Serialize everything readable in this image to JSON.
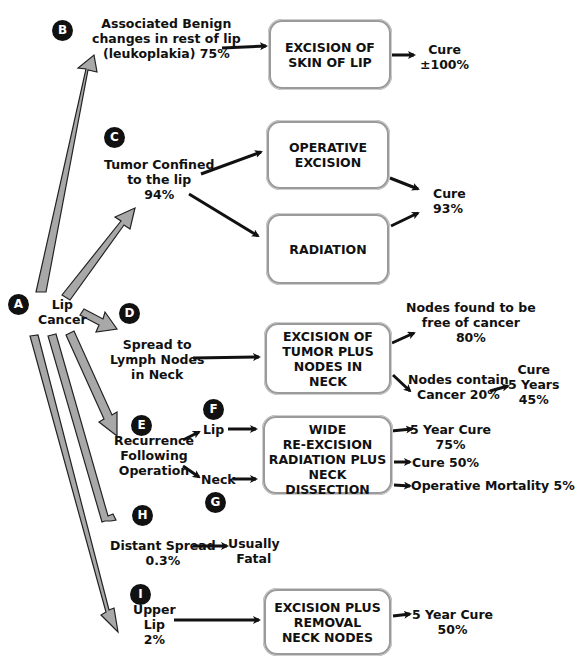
{
  "diagram": {
    "root": {
      "badge": "A",
      "label_lines": [
        "Lip",
        "Cancer"
      ]
    },
    "branches": {
      "B": {
        "badge": "B",
        "label_lines": [
          "Associated Benign",
          "changes in rest of lip",
          "(leukoplakia) 75%"
        ]
      },
      "C": {
        "badge": "C",
        "label_lines": [
          "Tumor Confined",
          "to the lip",
          "94%"
        ]
      },
      "D": {
        "badge": "D",
        "label_lines": [
          "Spread to",
          "Lymph Nodes",
          "in Neck"
        ]
      },
      "E": {
        "badge": "E",
        "label_lines": [
          "Recurrence",
          "Following",
          "Operation"
        ]
      },
      "F": {
        "badge": "F",
        "label": "Lip"
      },
      "G": {
        "badge": "G",
        "label": "Neck"
      },
      "H": {
        "badge": "H",
        "label_lines": [
          "Distant Spread",
          "0.3%"
        ]
      },
      "I": {
        "badge": "I",
        "label_lines": [
          "Upper",
          "Lip",
          "2%"
        ]
      }
    },
    "boxes": {
      "skin_excision": [
        "EXCISION OF",
        "SKIN OF LIP"
      ],
      "operative_excision": [
        "OPERATIVE",
        "EXCISION"
      ],
      "radiation": [
        "RADIATION"
      ],
      "tumor_nodes": [
        "EXCISION OF",
        "TUMOR PLUS",
        "NODES IN",
        "NECK"
      ],
      "wide_reexcision": [
        "WIDE",
        "RE-EXCISION"
      ],
      "radiation_neck": [
        "RADIATION PLUS",
        "NECK DISSECTION"
      ],
      "excision_removal": [
        "EXCISION PLUS",
        "REMOVAL",
        "NECK NODES"
      ]
    },
    "outcomes": {
      "cure_100": [
        "Cure",
        "±100%"
      ],
      "cure_93": [
        "Cure",
        "93%"
      ],
      "nodes_free": [
        "Nodes found to be",
        "free of cancer",
        "80%"
      ],
      "nodes_contain": [
        "Nodes contain",
        "Cancer 20%"
      ],
      "cure_5yr_45": [
        "Cure",
        "5 Years",
        "45%"
      ],
      "five_year_75": [
        "5 Year Cure",
        "75%"
      ],
      "cure_50": "Cure 50%",
      "op_mortality": "Operative Mortality 5%",
      "usually_fatal": [
        "Usually",
        "Fatal"
      ],
      "five_year_50": [
        "5 Year Cure",
        "50%"
      ]
    }
  }
}
